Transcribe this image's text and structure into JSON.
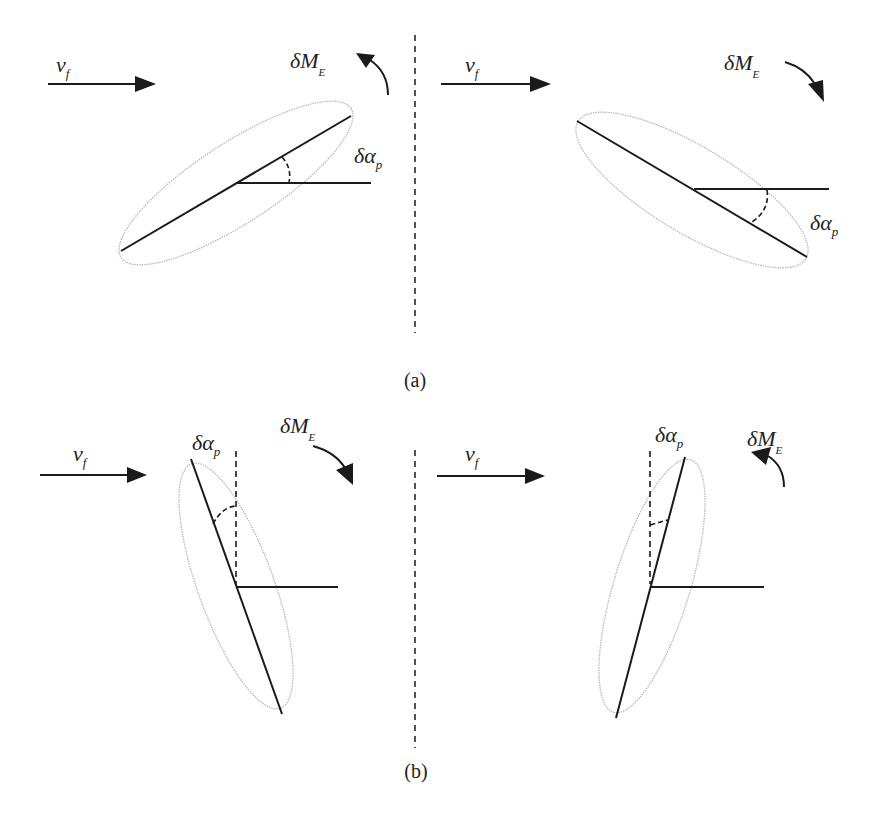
{
  "figure": {
    "panels": [
      {
        "id": "a",
        "caption": "(a)",
        "cases": [
          {
            "position": "left",
            "flow_label": {
              "main": "v",
              "sub": "f"
            },
            "moment_label": {
              "main": "δM",
              "sub": "E"
            },
            "moment_direction": "counter-clockwise",
            "angle_label": {
              "main": "δα",
              "sub": "p"
            },
            "plate_orientation": "tilted up to the right (nose-up)",
            "reference_line": "horizontal"
          },
          {
            "position": "right",
            "flow_label": {
              "main": "v",
              "sub": "f"
            },
            "moment_label": {
              "main": "δM",
              "sub": "E"
            },
            "moment_direction": "clockwise",
            "angle_label": {
              "main": "δα",
              "sub": "p"
            },
            "plate_orientation": "tilted down to the right (nose-down)",
            "reference_line": "horizontal"
          }
        ]
      },
      {
        "id": "b",
        "caption": "(b)",
        "cases": [
          {
            "position": "left",
            "flow_label": {
              "main": "v",
              "sub": "f"
            },
            "moment_label": {
              "main": "δM",
              "sub": "E"
            },
            "moment_direction": "clockwise",
            "angle_label": {
              "main": "δα",
              "sub": "p"
            },
            "plate_orientation": "near-vertical, leaning left at top",
            "reference_line": "vertical (dashed)"
          },
          {
            "position": "right",
            "flow_label": {
              "main": "v",
              "sub": "f"
            },
            "moment_label": {
              "main": "δM",
              "sub": "E"
            },
            "moment_direction": "counter-clockwise",
            "angle_label": {
              "main": "δα",
              "sub": "p"
            },
            "plate_orientation": "near-vertical, leaning right at top",
            "reference_line": "vertical (dashed)"
          }
        ]
      }
    ],
    "colors": {
      "ink": "#1a1a1a",
      "ellipse": "#b8b8b8"
    }
  }
}
